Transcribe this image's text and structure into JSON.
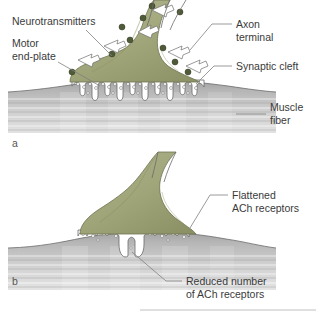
{
  "figure": {
    "title_visible": false,
    "background_color": "#ffffff",
    "panels": [
      {
        "letter": "a",
        "description": "Normal neuromuscular junction with deep junctional folds and abundant ACh receptors",
        "labels": [
          {
            "id": "neurotransmitters",
            "text": "Neurotransmitters",
            "side": "left"
          },
          {
            "id": "motor-end-plate",
            "line1": "Motor",
            "line2": "end-plate",
            "side": "left"
          },
          {
            "id": "axon-terminal",
            "line1": "Axon",
            "line2": "terminal",
            "side": "right"
          },
          {
            "id": "synaptic-cleft",
            "text": "Synaptic cleft",
            "side": "right"
          },
          {
            "id": "muscle-fiber",
            "line1": "Muscle",
            "line2": "fiber",
            "side": "right"
          }
        ]
      },
      {
        "letter": "b",
        "description": "Abnormal neuromuscular junction with flattened folds and reduced ACh receptors",
        "labels": [
          {
            "id": "flattened-ach-receptors",
            "line1": "Flattened",
            "line2": "ACh receptors",
            "side": "right"
          },
          {
            "id": "reduced-ach-receptors",
            "line1": "Reduced number",
            "line2": "of ACh receptors",
            "side": "right"
          }
        ]
      }
    ],
    "colors": {
      "axon_terminal_fill": "#a4a87d",
      "axon_terminal_shade": "#8e9368",
      "vesicle": "#4e5a38",
      "muscle_fiber_top": "#9b9b9b",
      "muscle_fiber_bottom": "#d8d8d8",
      "outline": "#6b6b6b",
      "leader_line": "#808080",
      "text": "#3a3a3a",
      "background": "#ffffff"
    }
  },
  "panel_a": {
    "letter": "a",
    "neurotransmitters_label": "Neurotransmitters",
    "motor_end_plate_line1": "Motor",
    "motor_end_plate_line2": "end-plate",
    "axon_terminal_line1": "Axon",
    "axon_terminal_line2": "terminal",
    "synaptic_cleft_label": "Synaptic cleft",
    "muscle_fiber_line1": "Muscle",
    "muscle_fiber_line2": "fiber"
  },
  "panel_b": {
    "letter": "b",
    "flattened_line1": "Flattened",
    "flattened_line2": "ACh receptors",
    "reduced_line1": "Reduced number",
    "reduced_line2": "of ACh receptors"
  }
}
